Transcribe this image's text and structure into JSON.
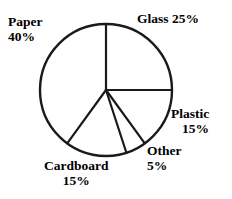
{
  "chart_data": {
    "type": "pie",
    "title": "",
    "subtitle": "",
    "xlabel": "",
    "ylabel": "",
    "grid": false,
    "legend": "none",
    "labels_position": "outside-around-circle",
    "start_angle_deg": 90,
    "direction": "clockwise",
    "stroke_color": "#1a1a1a",
    "fill_color": "#ffffff",
    "categories": [
      "Glass",
      "Plastic",
      "Other",
      "Cardboard",
      "Paper"
    ],
    "values": [
      25,
      15,
      5,
      15,
      40
    ],
    "units": "%",
    "slices": [
      {
        "name": "Glass",
        "value": 25,
        "value_text": "25%",
        "label_text": "Glass 25%",
        "start_deg": 0,
        "end_deg": 90
      },
      {
        "name": "Plastic",
        "value": 15,
        "value_text": "15%",
        "label_text": "Plastic",
        "start_deg": 90,
        "end_deg": 144
      },
      {
        "name": "Other",
        "value": 5,
        "value_text": "5%",
        "label_text": "Other",
        "start_deg": 144,
        "end_deg": 162
      },
      {
        "name": "Cardboard",
        "value": 15,
        "value_text": "15%",
        "label_text": "Cardboard",
        "start_deg": 162,
        "end_deg": 216
      },
      {
        "name": "Paper",
        "value": 40,
        "value_text": "40%",
        "label_text": "Paper",
        "start_deg": 216,
        "end_deg": 360
      }
    ]
  },
  "labels": {
    "paper": {
      "name": "Paper",
      "pct": "40%"
    },
    "glass": {
      "full": "Glass 25%"
    },
    "plastic": {
      "name": "Plastic",
      "pct": "15%"
    },
    "other": {
      "name": "Other",
      "pct": "5%"
    },
    "cardboard": {
      "name": "Cardboard",
      "pct": "15%"
    }
  }
}
